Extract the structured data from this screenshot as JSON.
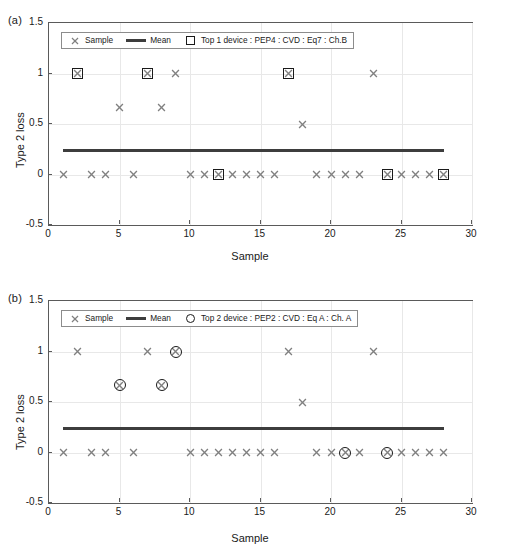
{
  "figure": {
    "width": 528,
    "height": 556,
    "background": "#ffffff",
    "marker_color": "#808080",
    "highlight_color": "#1a1a1a",
    "mean_color": "#3d3d3d",
    "grid_color": "#e8e8e8",
    "axis_color": "#5a5a5a"
  },
  "panels": [
    {
      "panel_label": "(a)",
      "legend": {
        "sample_label": "Sample",
        "mean_label": "Mean",
        "highlight_label": "Top 1 device : PEP4 : CVD : Eq7 : Ch.B",
        "sample_icon": "x-marker-icon",
        "mean_icon": "line-icon",
        "highlight_icon": "square-marker-icon"
      }
    },
    {
      "panel_label": "(b)",
      "legend": {
        "sample_label": "Sample",
        "mean_label": "Mean",
        "highlight_label": "Top 2 device : PEP2 : CVD : Eq A : Ch. A",
        "sample_icon": "x-marker-icon",
        "mean_icon": "line-icon",
        "highlight_icon": "circle-marker-icon"
      }
    }
  ],
  "chart_data": [
    {
      "type": "scatter",
      "panel": "(a)",
      "title": "",
      "xlabel": "Sample",
      "ylabel": "Type 2 loss",
      "xlim": [
        0,
        30
      ],
      "ylim": [
        -0.5,
        1.5
      ],
      "xticks": [
        0,
        5,
        10,
        15,
        20,
        25,
        30
      ],
      "xticklabels": [
        "0",
        "5",
        "10",
        "15",
        "20",
        "25",
        "30"
      ],
      "yticks": [
        -0.5,
        0,
        0.5,
        1,
        1.5
      ],
      "yticklabels": [
        "-0.5",
        "0",
        "0.5",
        "1",
        "1.5"
      ],
      "grid": true,
      "legend_position": "top-left-inside",
      "series": [
        {
          "name": "Sample",
          "marker": "x",
          "x": [
            1,
            2,
            3,
            4,
            5,
            6,
            7,
            8,
            9,
            10,
            11,
            12,
            13,
            14,
            15,
            16,
            17,
            18,
            19,
            20,
            21,
            22,
            23,
            24,
            25,
            26,
            27,
            28
          ],
          "values": [
            0,
            1,
            0,
            0,
            0.667,
            0,
            1,
            0.667,
            1,
            0,
            0,
            0,
            0,
            0,
            0,
            0,
            1,
            0.5,
            0,
            0,
            0,
            0,
            1,
            0,
            0,
            0,
            0,
            0
          ]
        },
        {
          "name": "Top 1 device : PEP4 : CVD : Eq7 : Ch.B",
          "marker": "square",
          "x": [
            2,
            7,
            12,
            17,
            24,
            28
          ],
          "values": [
            1,
            1,
            0,
            1,
            0,
            0
          ]
        },
        {
          "name": "Mean",
          "marker": "line",
          "x": [
            1,
            28
          ],
          "values": [
            0.238,
            0.238
          ]
        }
      ]
    },
    {
      "type": "scatter",
      "panel": "(b)",
      "title": "",
      "xlabel": "Sample",
      "ylabel": "Type 2 loss",
      "xlim": [
        0,
        30
      ],
      "ylim": [
        -0.5,
        1.5
      ],
      "xticks": [
        0,
        5,
        10,
        15,
        20,
        25,
        30
      ],
      "xticklabels": [
        "0",
        "5",
        "10",
        "15",
        "20",
        "25",
        "30"
      ],
      "yticks": [
        -0.5,
        0,
        0.5,
        1,
        1.5
      ],
      "yticklabels": [
        "-0.5",
        "0",
        "0.5",
        "1",
        "1.5"
      ],
      "grid": true,
      "legend_position": "top-left-inside",
      "series": [
        {
          "name": "Sample",
          "marker": "x",
          "x": [
            1,
            2,
            3,
            4,
            5,
            6,
            7,
            8,
            9,
            10,
            11,
            12,
            13,
            14,
            15,
            16,
            17,
            18,
            19,
            20,
            21,
            22,
            23,
            24,
            25,
            26,
            27,
            28
          ],
          "values": [
            0,
            1,
            0,
            0,
            0.667,
            0,
            1,
            0.667,
            1,
            0,
            0,
            0,
            0,
            0,
            0,
            0,
            1,
            0.5,
            0,
            0,
            0,
            0,
            1,
            0,
            0,
            0,
            0,
            0
          ]
        },
        {
          "name": "Top 2 device : PEP2 : CVD : Eq A : Ch. A",
          "marker": "circle",
          "x": [
            5,
            8,
            9,
            21,
            24
          ],
          "values": [
            0.667,
            0.667,
            1,
            0,
            0
          ]
        },
        {
          "name": "Mean",
          "marker": "line",
          "x": [
            1,
            28
          ],
          "values": [
            0.238,
            0.238
          ]
        }
      ]
    }
  ]
}
